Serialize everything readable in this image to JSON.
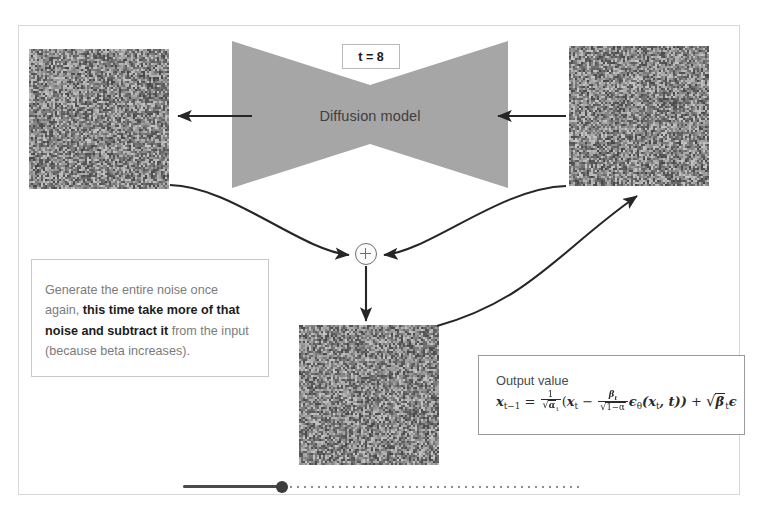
{
  "slide": {
    "title_label": "Diffusion reverse step",
    "model": {
      "label": "Diffusion model",
      "shape": "hourglass-unet",
      "fill_color": "#a6a6a6"
    },
    "timestep_badge": {
      "label": "t = 8",
      "value": 8
    },
    "images": [
      {
        "name": "denoised-output-noise",
        "position": "left",
        "alt": "grayscale random noise image"
      },
      {
        "name": "input-noise",
        "position": "right",
        "alt": "grayscale random noise image"
      },
      {
        "name": "next-step-noise",
        "position": "bottom",
        "alt": "grayscale random noise image"
      }
    ],
    "note": {
      "line1": "Generate the entire noise once again,",
      "bold1": "this time take more of that noise and",
      "bold2": "subtract it",
      "line2": " from the input (because",
      "line3": "beta increases)."
    },
    "formula": {
      "title": "Output value",
      "latex": "x_{t-1} = \\frac{1}{\\sqrt{\\alpha_t}}(x_t - \\frac{\\beta_t}{\\sqrt{1-\\bar{\\alpha}}}\\epsilon_\\theta(x_t, t)) + \\sqrt{\\beta_t}\\epsilon",
      "lhs": "x",
      "lhs_sub": "t−1",
      "equals": "=",
      "coef_num": "1",
      "coef_den_radical": "√",
      "coef_den": "α",
      "coef_den_sub": "t",
      "open_paren": "(",
      "x_t": "x",
      "x_t_sub": "t",
      "minus": "−",
      "beta_num": "β",
      "beta_num_sub": "t",
      "beta_den_radical": "√",
      "beta_den": "1−α",
      "eps_theta": "ϵ",
      "eps_theta_sub": "θ",
      "eps_args": "(x",
      "eps_args_sub": "t",
      "eps_args_tail": ", t))",
      "plus": "+",
      "tail_radical": "√",
      "tail_beta": "β",
      "tail_beta_sub": "t",
      "tail_eps": "ϵ"
    },
    "sum_node": {
      "operator": "+",
      "name": "addition-node"
    },
    "timeline": {
      "progress_percent": 25,
      "handle_position_percent": 25
    },
    "colors": {
      "model_fill": "#a6a6a6",
      "frame_border": "#d8d8d8",
      "note_text": "#7b7b7b",
      "note_bold": "#1c1c1c",
      "arrow": "#262626"
    }
  }
}
